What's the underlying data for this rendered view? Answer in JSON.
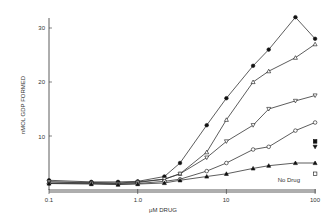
{
  "chart_data": {
    "type": "scatter",
    "title": "",
    "xlabel": "µM DRUG",
    "ylabel": "nMOL GDP FORMED",
    "x_scale": "log",
    "xlim": [
      0.1,
      100
    ],
    "ylim": [
      0,
      32
    ],
    "x_ticks": [
      "0.1",
      "1.0",
      "10",
      "100"
    ],
    "y_ticks": [
      "10",
      "20",
      "30"
    ],
    "annotations": [
      "No Drug"
    ],
    "series": [
      {
        "name": "filled circle",
        "marker": "filled-circle",
        "x": [
          0.1,
          0.3,
          0.6,
          1.0,
          2,
          3,
          6,
          10,
          20,
          30,
          60,
          100
        ],
        "y": [
          1.8,
          1.5,
          1.5,
          1.6,
          2.5,
          5,
          12,
          17,
          23,
          26,
          32,
          28
        ]
      },
      {
        "name": "open triangle",
        "marker": "open-triangle",
        "x": [
          0.1,
          0.3,
          0.6,
          1.0,
          2,
          3,
          6,
          10,
          20,
          30,
          60,
          100
        ],
        "y": [
          1.5,
          1.4,
          1.3,
          1.5,
          2,
          3,
          7,
          13,
          20,
          22,
          24.5,
          27
        ]
      },
      {
        "name": "open inverted triangle",
        "marker": "open-inv-triangle",
        "x": [
          0.1,
          0.3,
          0.6,
          1.0,
          2,
          3,
          6,
          10,
          20,
          30,
          60,
          100
        ],
        "y": [
          1.5,
          1.3,
          1.2,
          1.4,
          2,
          3,
          6,
          9,
          12,
          15,
          16.5,
          17.5
        ]
      },
      {
        "name": "open circle",
        "marker": "open-circle",
        "x": [
          0.1,
          0.3,
          0.6,
          1.0,
          2,
          3,
          6,
          10,
          20,
          30,
          60,
          100
        ],
        "y": [
          1.2,
          1.2,
          1.1,
          1.2,
          1.6,
          2,
          3.5,
          5,
          7.5,
          8,
          11,
          12.5
        ]
      },
      {
        "name": "filled triangle",
        "marker": "filled-triangle",
        "x": [
          0.1,
          0.3,
          0.6,
          1.0,
          2,
          3,
          6,
          10,
          20,
          30,
          60,
          100
        ],
        "y": [
          1.2,
          1.1,
          1.0,
          1.1,
          1.3,
          1.8,
          2.5,
          3,
          4,
          4.5,
          5,
          5
        ]
      },
      {
        "name": "No Drug",
        "marker": "open-square",
        "x": [
          100
        ],
        "y": [
          3
        ]
      },
      {
        "name": "filled square",
        "marker": "filled-square",
        "x": [
          100
        ],
        "y": [
          9
        ]
      },
      {
        "name": "filled inv triangle",
        "marker": "filled-inv-triangle",
        "x": [
          100
        ],
        "y": [
          8
        ]
      }
    ]
  }
}
